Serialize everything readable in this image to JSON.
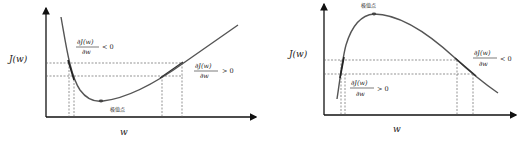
{
  "left_panel": {
    "y_axis_label": "J(w)",
    "x_axis_label": "w",
    "extremum_label": "极值点",
    "annotation_left": {
      "numerator": "∂J(w)",
      "denominator": "∂w",
      "relation": "< 0"
    },
    "annotation_right": {
      "numerator": "∂J(w)",
      "denominator": "∂w",
      "relation": "> 0"
    },
    "curve_shape": "convex (minimum)"
  },
  "right_panel": {
    "y_axis_label": "J(w)",
    "x_axis_label": "w",
    "extremum_label": "极值点",
    "annotation_left": {
      "numerator": "∂J(w)",
      "denominator": "∂w",
      "relation": "> 0"
    },
    "annotation_right": {
      "numerator": "∂J(w)",
      "denominator": "∂w",
      "relation": "< 0"
    },
    "curve_shape": "concave (maximum)"
  },
  "colors": {
    "curve": "#555555",
    "axis": "#111111",
    "dashed": "#666666",
    "point": "#444444"
  }
}
